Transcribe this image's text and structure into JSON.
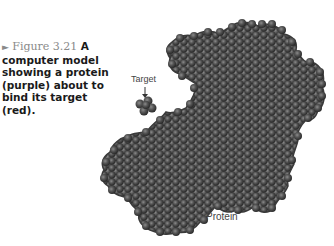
{
  "figure": {
    "arrow_glyph": "►",
    "number": "Figure 3.21",
    "caption_text": "A computer model showing a protein (purple) about to bind its target (red).",
    "labels": {
      "target": "Target",
      "protein": "Protein"
    },
    "colors": {
      "molecule_dark": "#2e2e2e",
      "molecule_mid": "#4a4a4a",
      "molecule_highlight": "#7a7a7a",
      "figure_label": "#8a8a8a",
      "caption_text": "#1a1a1a"
    }
  }
}
